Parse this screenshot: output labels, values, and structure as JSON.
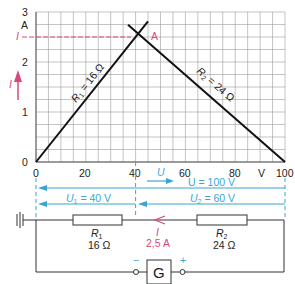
{
  "chart_data": {
    "type": "line",
    "title": "",
    "xlabel": "U",
    "xunit": "V",
    "ylabel": "I",
    "yunit": "A",
    "xlim": [
      0,
      100
    ],
    "ylim": [
      0,
      3
    ],
    "grid": true,
    "x_ticks": [
      "0",
      "20",
      "40",
      "60",
      "80",
      "100"
    ],
    "y_ticks": [
      "0",
      "1",
      "2",
      "3"
    ],
    "series": [
      {
        "name": "R1 = 16 Ω",
        "label_main": "R",
        "label_sub": "1",
        "label_rest": " = 16 Ω",
        "points": [
          [
            0,
            0
          ],
          [
            45,
            2.8125
          ]
        ]
      },
      {
        "name": "R2 = 24 Ω",
        "label_main": "R",
        "label_sub": "2",
        "label_rest": " = 24 Ω",
        "points": [
          [
            37,
            2.625
          ],
          [
            100,
            0
          ]
        ]
      }
    ],
    "intersection": {
      "x": 40,
      "y": 2.5,
      "label": "A"
    },
    "annotations": {
      "current_marker": "I",
      "current_axis_arrow": "I"
    }
  },
  "axis": {
    "x_unit": "V",
    "y_unit": "A",
    "x_arrow_label": "U",
    "y_arrow_label": "I"
  },
  "voltages": {
    "total": "U = 100 V",
    "u1_main": "U",
    "u1_sub": "1",
    "u1_rest": " = 40 V",
    "u2_main": "U",
    "u2_sub": "2",
    "u2_rest": " = 60 V"
  },
  "circuit": {
    "r1_name": "R",
    "r1_sub": "1",
    "r1_value": "16 Ω",
    "r2_name": "R",
    "r2_sub": "2",
    "r2_value": "24 Ω",
    "current_label": "I",
    "current_value": "2,5 A",
    "generator_label": "G",
    "minus": "−",
    "plus": "+"
  },
  "colors": {
    "grid": "#9a9a9a",
    "line": "#111111",
    "accent_blue": "#3aa6d0",
    "accent_red": "#d8487a"
  }
}
